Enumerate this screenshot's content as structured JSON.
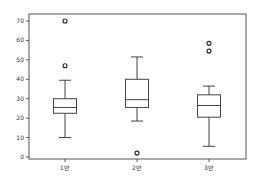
{
  "chart_data": {
    "type": "box",
    "title": "",
    "xlabel": "",
    "ylabel": "",
    "ylim": [
      -1,
      74
    ],
    "yticks": [
      0,
      10,
      20,
      30,
      40,
      50,
      60,
      70
    ],
    "grid": false,
    "legend": null,
    "categories": [
      "1반",
      "2반",
      "3반"
    ],
    "boxes": [
      {
        "label": "1반",
        "whisker_low": 10,
        "q1": 22.5,
        "median": 25.5,
        "q3": 30,
        "whisker_high": 39.5,
        "outliers": [
          47,
          70
        ]
      },
      {
        "label": "2반",
        "whisker_low": 18.5,
        "q1": 25.5,
        "median": 29.5,
        "q3": 40,
        "whisker_high": 51.5,
        "outliers": [
          2
        ]
      },
      {
        "label": "3반",
        "whisker_low": 5.5,
        "q1": 20.5,
        "median": 26.5,
        "q3": 32,
        "whisker_high": 36.5,
        "outliers": [
          54.5,
          58.5
        ]
      }
    ],
    "colors": {
      "line": "#444444",
      "frame": "#555555",
      "text": "#333333"
    }
  }
}
